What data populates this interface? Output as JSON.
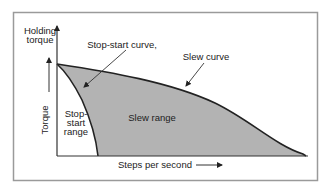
{
  "diagram": {
    "axes": {
      "y_top_label": [
        "Holding",
        "torque"
      ],
      "y_label": "Torque",
      "x_label": "Steps per second"
    },
    "curves": {
      "slew_curve_label": "Slew curve",
      "stop_start_curve_label": "Stop-start curve,"
    },
    "regions": {
      "stop_start_range_label": [
        "Stop-",
        "start",
        "range"
      ],
      "slew_range_label": "Slew range"
    },
    "colors": {
      "fill": "#b3b3b3",
      "line": "#222222",
      "frame": "#9a9a9a",
      "background": "#ffffff"
    }
  }
}
